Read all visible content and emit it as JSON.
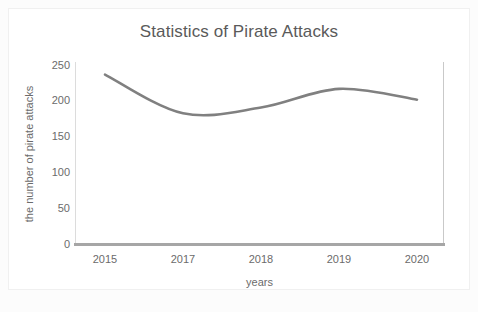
{
  "chart_data": {
    "type": "line",
    "title": "Statistics of Pirate Attacks",
    "xlabel": "years",
    "ylabel": "the number of pirate attacks",
    "categories": [
      "2015",
      "2017",
      "2018",
      "2019",
      "2020"
    ],
    "x_tick_labels": [
      "2015",
      "2017",
      "2018",
      "2019",
      "2020"
    ],
    "y_tick_labels": [
      "250",
      "200",
      "150",
      "100",
      "50",
      "0"
    ],
    "ylim": [
      0,
      250
    ],
    "y_ticks": [
      0,
      50,
      100,
      150,
      200,
      250
    ],
    "grid": false,
    "legend": "none",
    "series": [
      {
        "name": "number of pirate attacks",
        "color": "#808080",
        "values": [
          236,
          182,
          190,
          216,
          201
        ]
      }
    ],
    "line_color": "#808080",
    "line_width": 2.6,
    "smoothing": "spline",
    "background_color": "#ffffff",
    "axis_color": "#a6a6a6",
    "text_color": "#6b6b6b",
    "title_color": "#5a5a5a"
  },
  "ticks": {
    "y": [
      {
        "label": "250",
        "top": 59
      },
      {
        "label": "200",
        "top": 94
      },
      {
        "label": "150",
        "top": 130
      },
      {
        "label": "100",
        "top": 166
      },
      {
        "label": "50",
        "top": 202
      },
      {
        "label": "0",
        "top": 238
      }
    ],
    "x": [
      {
        "label": "2015",
        "left": 75
      },
      {
        "label": "2017",
        "left": 153
      },
      {
        "label": "2018",
        "left": 231
      },
      {
        "label": "2019",
        "left": 309
      },
      {
        "label": "2020",
        "left": 387
      }
    ]
  }
}
